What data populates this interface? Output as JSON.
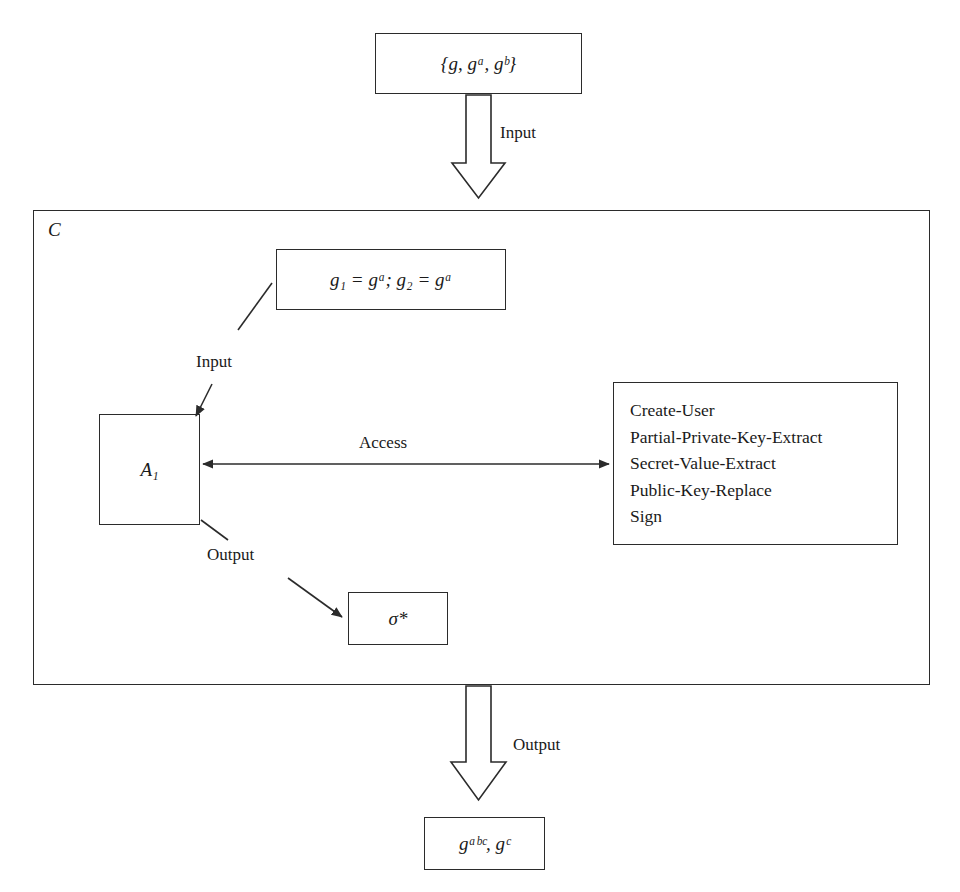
{
  "diagram": {
    "stroke_color": "#2b2b2b",
    "background_color": "#ffffff",
    "container": {
      "label": "C",
      "name": "challenger-container"
    },
    "nodes": [
      {
        "id": "input-params",
        "name": "input-parameters-box",
        "text": "{g, gᵃ, gᵇ}"
      },
      {
        "id": "generators",
        "name": "generators-assignment-box",
        "text": "g₁ = gᵃ;  g₂ = gᵃ"
      },
      {
        "id": "adversary",
        "name": "adversary-box",
        "text": "A₁"
      },
      {
        "id": "sigma",
        "name": "forged-signature-box",
        "text": "σ*"
      },
      {
        "id": "output-values",
        "name": "output-values-box",
        "text": "gᵃᵇᶜ, gᶜ"
      }
    ],
    "oracles": {
      "name": "oracle-query-list",
      "items": [
        "Create-User",
        "Partial-Private-Key-Extract",
        "Secret-Value-Extract",
        "Public-Key-Replace",
        "Sign"
      ]
    },
    "edges": [
      {
        "id": "input-top",
        "name": "edge-label-input-top",
        "label": "Input",
        "style": "block-arrow-down"
      },
      {
        "id": "input-mid",
        "name": "edge-label-input-mid",
        "label": "Input",
        "style": "line-arrow-diagonal"
      },
      {
        "id": "access",
        "name": "edge-label-access",
        "label": "Access",
        "style": "double-headed-arrow"
      },
      {
        "id": "output-mid",
        "name": "edge-label-output-mid",
        "label": "Output",
        "style": "line-arrow-diagonal"
      },
      {
        "id": "output-bot",
        "name": "edge-label-output-bot",
        "label": "Output",
        "style": "block-arrow-down"
      }
    ]
  }
}
